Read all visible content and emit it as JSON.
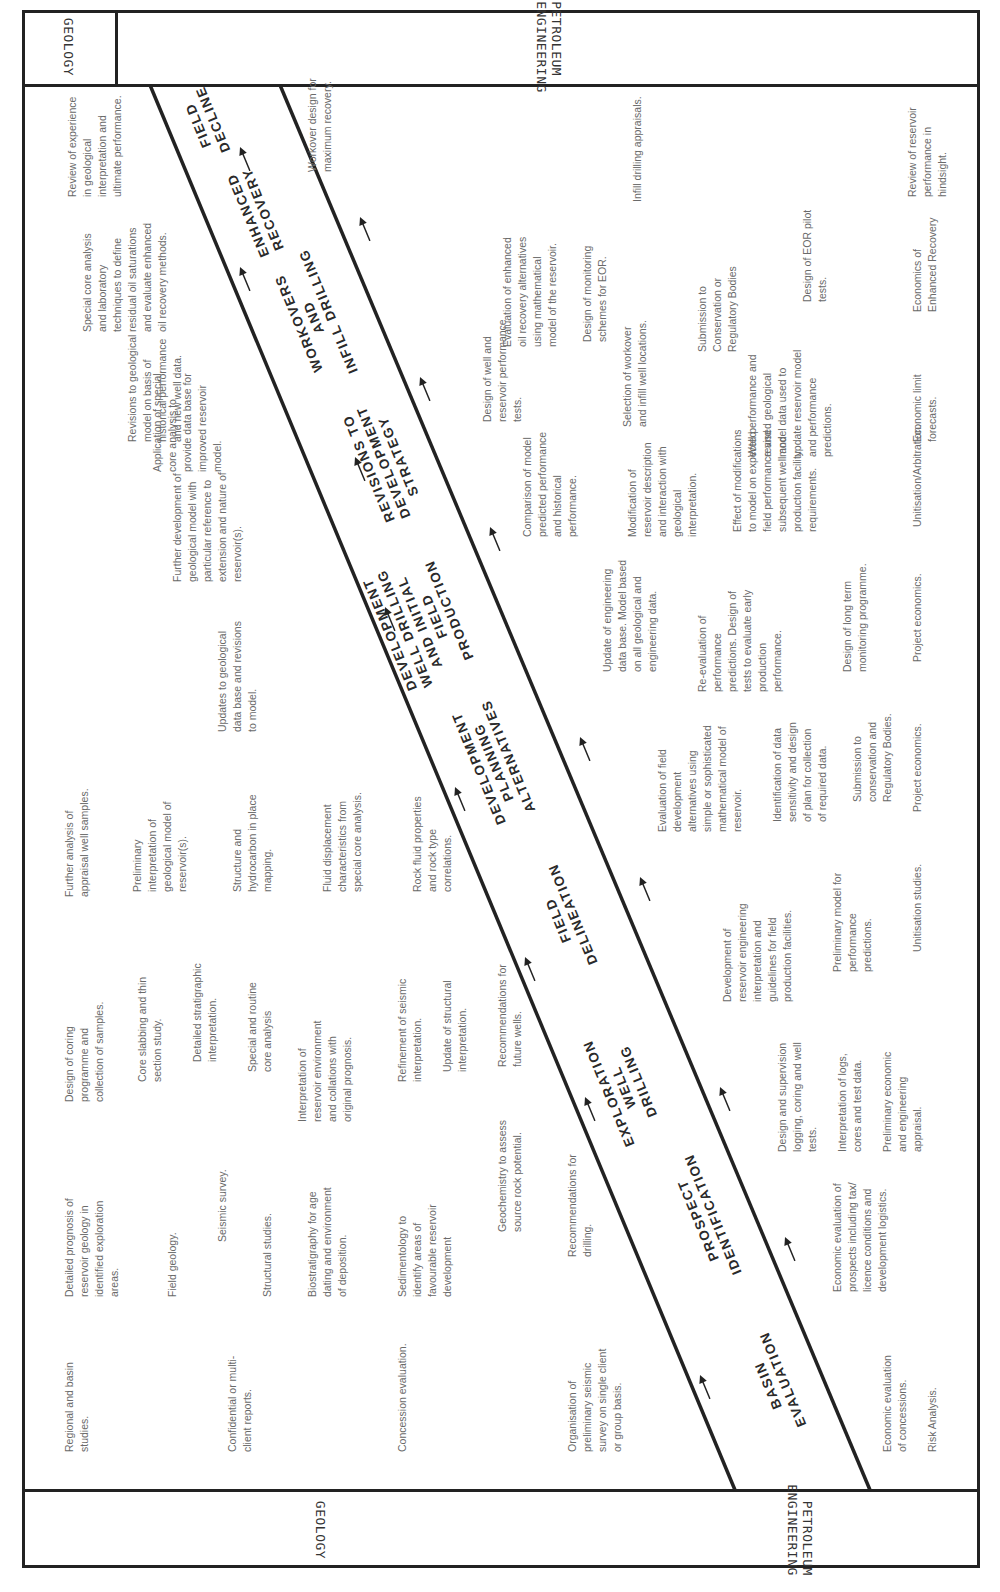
{
  "headers": {
    "left_top": "PETROLEUM\nENGINEERING",
    "left_bottom": "GEOLOGY",
    "right_top": "GEOLOGY",
    "right_bottom": "PETROLEUM ENGINEERING"
  },
  "stages": [
    {
      "id": "basin-evaluation",
      "label": "BASIN\nEVALUATION"
    },
    {
      "id": "prospect-identification",
      "label": "PROSPECT\nIDENTIFICATION"
    },
    {
      "id": "exploration-well-drilling",
      "label": "EXPLORATION\nWELL\nDRILLING"
    },
    {
      "id": "field-delineation",
      "label": "FIELD\nDELINEATION"
    },
    {
      "id": "development-planning-alternatives",
      "label": "DEVELOPMENT\nPLANNING\nALTERNATIVES"
    },
    {
      "id": "development-well-drilling",
      "label": "DEVELOPMENT\nWELL DRILLING\nAND INITIAL\nFIELD\nPRODUCTION"
    },
    {
      "id": "revisions-to-development-strategy",
      "label": "REVISIONS TO\nDEVELOPMENT\nSTRATEGY"
    },
    {
      "id": "workovers-infill-drilling",
      "label": "WORKOVERS\nAND\nINFILL DRILLING"
    },
    {
      "id": "enhanced-recovery",
      "label": "ENHANCED\nRECOVERY"
    },
    {
      "id": "field-decline",
      "label": "FIELD\nDECLINE"
    }
  ],
  "geology_notes": [
    "Regional and basin\nstudies.",
    "Confidential or multi-\nclient reports.",
    "Concession evaluation.",
    "Organisation of\npreliminary seismic\nsurvey on single client\nor group basis.",
    "Detailed prognosis of\nreservoir geology in\nidentified exploration\nareas.",
    "Field geology.",
    "Seismic survey.",
    "Structural studies.",
    "Biostratigraphy for age\ndating and environment\nof deposition.",
    "Sedimentology to\nidentify areas of\nfavourable reservoir\ndevelopment",
    "Geochemistry to assess\nsource rock potential.",
    "Recommendations for\ndrilling.",
    "Design of coring\nprogramme and\ncollection of samples.",
    "Core slabbing and thin\nsection study.",
    "Detailed stratigraphic\ninterpretation.",
    "Special and routine\ncore analysis",
    "Interpretation of\nreservoir environment\nand collations with\noriginal prognosis.",
    "Refinement of seismic\ninterpretation.",
    "Update of structural\ninterpretation.",
    "Recommendations for\nfuture wells.",
    "Further analysis of\nappraisal well samples.",
    "Preliminary\ninterpretation of\ngeological model of\nreservoir(s).",
    "Structure and\nhydrocarbon in place\nmapping.",
    "Fluid displacement\ncharacteristics from\nspecial core analysis.",
    "Rock fluid properties\nand rock type\ncorrelations.",
    "Updates to geological\ndata base and revisions\nto model.",
    "Further development of\ngeological model with\nparticular reference to\nextension and nature of\nreservoir(s).",
    "Application of special\ncore analysis to\nprovide data base for\nimproved reservoir\nmodel.",
    "Revisions to geological\nmodel on basis of\nhistorical performance\nand new well data.",
    "Special core analysis\nand laboratory\ntechniques to define\nresidual oil saturations\nand evaluate enhanced\noil recovery methods.",
    "Review of experience\nin geological\ninterpretation and\nultimate performance."
  ],
  "engineering_notes": [
    "Economic evaluation\nof concessions.",
    "Risk Analysis.",
    "Economic evaluation of\nprospects including tax/\nlicence conditions and\ndevelopment logistics.",
    "Design and supervision\nlogging, coring and well\ntests.",
    "Interpretation of logs,\ncores and test data.",
    "Preliminary economic\nand engineering\nappraisal.",
    "Development of\nreservoir engineering\ninterpretation and\nguidelines for field\nproduction facilities.",
    "Preliminary model for\nperformance\npredictions.",
    "Unitisation studies.",
    "Evaluation of field\ndevelopment\nalternatives using\nsimple or sophisticated\nmathematical model of\nreservoir.",
    "Identification of data\nsensitivity and design\nof plan for collection\nof  required data.",
    "Submission to\nconservation and\nRegulatory Bodies.",
    "Project economics.",
    "Update of engineering\ndata base. Model based\non all geological and\nengineering data.",
    "Re-evaluation of\nperformance\npredictions.  Design of\ntests to evaluate early\nproduction\nperformance.",
    "Design of long term\nmonitoring programme.",
    "Project economics.",
    "Comparison of model\npredicted performance\nand historical\nperformance.",
    "Modification of\nreservoir description\nand interaction with\ngeological\ninterpretation.",
    "Effect of modifications\nto model on expected\nfield performance and\nsubsequent well and\nproduction facility\nrequirements.",
    "Unitisation/Arbitration.",
    "Design of well and\nreservoir performance\ntests.",
    "Selection of workover\nand infill well locations.",
    "Well performance and\nrevised geological\nmodel data used to\nupdate reservoir model\nand performance\npredictions.",
    "Economic limit\nforecasts.",
    "Evaluation of enhanced\noil recovery alternatives\nusing mathematical\nmodel of the reservoir.",
    "Design of monitoring\nschemes for EOR.",
    "Submission to\nConservation or\nRegulatory Bodies",
    "Design of EOR pilot\ntests.",
    "Economics of\nEnhanced Recovery",
    "Workover design for\nmaximum recovery.",
    "Infill drilling appraisals.",
    "Review of reservoir\nperformance in\nhindsight."
  ],
  "colors": {
    "line": "#222222",
    "text": "#6a6a6a",
    "stage_text": "#2a2a2a"
  }
}
